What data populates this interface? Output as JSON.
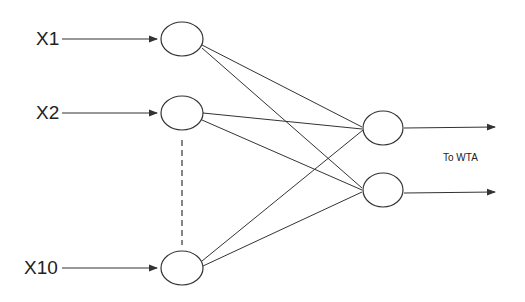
{
  "diagram": {
    "inputs": [
      {
        "label": "X1",
        "y": 39
      },
      {
        "label": "X2",
        "y": 113
      },
      {
        "label": "X10",
        "y": 268
      }
    ],
    "outputs": [
      {
        "y": 127
      },
      {
        "y": 190
      }
    ],
    "output_label": "To WTA",
    "line_color": "#333333"
  }
}
